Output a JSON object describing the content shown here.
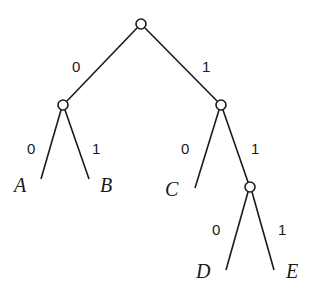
{
  "diagram": {
    "type": "binary-code-tree",
    "nodes": {
      "root": {
        "x": 141,
        "y": 24
      },
      "n0": {
        "x": 63,
        "y": 105
      },
      "n1": {
        "x": 221,
        "y": 105
      },
      "n11": {
        "x": 250,
        "y": 187
      }
    },
    "node_radius": 5,
    "edges": [
      {
        "from": "root",
        "to": "n0",
        "label": "0"
      },
      {
        "from": "root",
        "to": "n1",
        "label": "1"
      },
      {
        "from": "n0",
        "to": "A",
        "label": "0"
      },
      {
        "from": "n0",
        "to": "B",
        "label": "1"
      },
      {
        "from": "n1",
        "to": "C",
        "label": "0"
      },
      {
        "from": "n1",
        "to": "n11",
        "label": "1"
      },
      {
        "from": "n11",
        "to": "D",
        "label": "0"
      },
      {
        "from": "n11",
        "to": "E",
        "label": "1"
      }
    ],
    "leaves": {
      "A": {
        "label": "A",
        "code": "00"
      },
      "B": {
        "label": "B",
        "code": "01"
      },
      "C": {
        "label": "C",
        "code": "10"
      },
      "D": {
        "label": "D",
        "code": "110"
      },
      "E": {
        "label": "E",
        "code": "111"
      }
    }
  }
}
